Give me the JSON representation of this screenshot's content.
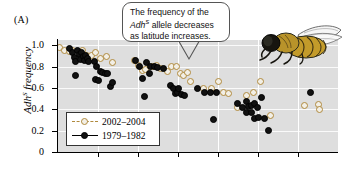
{
  "figure": {
    "panel_label": "(A)",
    "background_color": "#ffffff",
    "plot_background_color": "#dedede",
    "gridline_color": "#ffffff"
  },
  "callout": {
    "line1": "The frequency of the",
    "allele_italic": "Adh",
    "allele_sup": "S",
    "line2_rest": " allele decreases",
    "line3": "as latitude increases.",
    "full_text": "The frequency of the AdhS allele decreases as latitude increases."
  },
  "legend": {
    "items": [
      {
        "label": "2002–2004",
        "marker": "open-circle",
        "color": "#b08a3e",
        "line": "dashed"
      },
      {
        "label": "1979–1982",
        "marker": "filled-circle",
        "color": "#111111",
        "line": "solid"
      }
    ]
  },
  "axes": {
    "y_title_italic": "Adh",
    "y_title_sup": "S",
    "y_title_rest": " frequency",
    "y_ticks": [
      "1.0",
      "0.8",
      "0.6",
      "0.4",
      "0.2",
      "0"
    ],
    "y_tick_values": [
      1.0,
      0.8,
      0.6,
      0.4,
      0.2,
      0
    ],
    "x_ticks_labels": [],
    "x_tick_count": 6
  },
  "fly_illustration": {
    "name": "drosophila-fly",
    "body_color": "#c39b2a",
    "head_color": "#111111",
    "wing_color": "#f4f4f4"
  },
  "chart_data": {
    "type": "scatter",
    "title": "",
    "xlabel": "",
    "ylabel": "AdhS frequency",
    "ylim": [
      0,
      1.05
    ],
    "xlim": [
      0,
      1
    ],
    "grid": true,
    "legend_position": "bottom-left",
    "series": [
      {
        "name": "2002–2004",
        "marker": "open-circle",
        "color": "#b08a3e",
        "points": [
          [
            0.005,
            0.98
          ],
          [
            0.022,
            0.955
          ],
          [
            0.04,
            0.945
          ],
          [
            0.052,
            0.955
          ],
          [
            0.088,
            0.955
          ],
          [
            0.1,
            0.905
          ],
          [
            0.118,
            0.905
          ],
          [
            0.133,
            0.93
          ],
          [
            0.15,
            0.88
          ],
          [
            0.172,
            0.9
          ],
          [
            0.196,
            0.84
          ],
          [
            0.272,
            0.855
          ],
          [
            0.288,
            0.815
          ],
          [
            0.3,
            0.76
          ],
          [
            0.312,
            0.77
          ],
          [
            0.336,
            0.805
          ],
          [
            0.352,
            0.81
          ],
          [
            0.366,
            0.785
          ],
          [
            0.392,
            0.755
          ],
          [
            0.404,
            0.8
          ],
          [
            0.422,
            0.8
          ],
          [
            0.436,
            0.74
          ],
          [
            0.448,
            0.72
          ],
          [
            0.462,
            0.745
          ],
          [
            0.472,
            0.66
          ],
          [
            0.52,
            0.595
          ],
          [
            0.548,
            0.595
          ],
          [
            0.572,
            0.66
          ],
          [
            0.592,
            0.56
          ],
          [
            0.61,
            0.55
          ],
          [
            0.64,
            0.42
          ],
          [
            0.672,
            0.53
          ],
          [
            0.698,
            0.56
          ],
          [
            0.724,
            0.66
          ],
          [
            0.76,
            0.34
          ],
          [
            0.88,
            0.435
          ],
          [
            0.93,
            0.45
          ],
          [
            0.934,
            0.4
          ]
        ]
      },
      {
        "name": "1979–1982",
        "marker": "filled-circle",
        "color": "#111111",
        "points": [
          [
            0.04,
            0.975
          ],
          [
            0.052,
            0.93
          ],
          [
            0.058,
            0.885
          ],
          [
            0.062,
            0.845
          ],
          [
            0.07,
            0.955
          ],
          [
            0.076,
            0.91
          ],
          [
            0.08,
            0.87
          ],
          [
            0.084,
            0.935
          ],
          [
            0.09,
            0.9
          ],
          [
            0.094,
            0.86
          ],
          [
            0.098,
            0.905
          ],
          [
            0.104,
            0.875
          ],
          [
            0.108,
            0.845
          ],
          [
            0.062,
            0.72
          ],
          [
            0.13,
            0.85
          ],
          [
            0.136,
            0.8
          ],
          [
            0.15,
            0.755
          ],
          [
            0.16,
            0.745
          ],
          [
            0.17,
            0.74
          ],
          [
            0.176,
            0.735
          ],
          [
            0.134,
            0.68
          ],
          [
            0.146,
            0.67
          ],
          [
            0.186,
            0.61
          ],
          [
            0.196,
            0.655
          ],
          [
            0.278,
            0.86
          ],
          [
            0.29,
            0.8
          ],
          [
            0.3,
            0.69
          ],
          [
            0.316,
            0.84
          ],
          [
            0.33,
            0.805
          ],
          [
            0.344,
            0.805
          ],
          [
            0.356,
            0.79
          ],
          [
            0.326,
            0.735
          ],
          [
            0.31,
            0.52
          ],
          [
            0.376,
            0.78
          ],
          [
            0.4,
            0.62
          ],
          [
            0.412,
            0.6
          ],
          [
            0.42,
            0.545
          ],
          [
            0.428,
            0.56
          ],
          [
            0.432,
            0.6
          ],
          [
            0.44,
            0.54
          ],
          [
            0.45,
            0.53
          ],
          [
            0.498,
            0.6
          ],
          [
            0.522,
            0.56
          ],
          [
            0.545,
            0.555
          ],
          [
            0.566,
            0.555
          ],
          [
            0.556,
            0.305
          ],
          [
            0.64,
            0.455
          ],
          [
            0.658,
            0.42
          ],
          [
            0.672,
            0.47
          ],
          [
            0.68,
            0.43
          ],
          [
            0.69,
            0.44
          ],
          [
            0.7,
            0.455
          ],
          [
            0.712,
            0.42
          ],
          [
            0.726,
            0.51
          ],
          [
            0.672,
            0.375
          ],
          [
            0.69,
            0.37
          ],
          [
            0.7,
            0.31
          ],
          [
            0.716,
            0.325
          ],
          [
            0.736,
            0.31
          ],
          [
            0.752,
            0.205
          ],
          [
            0.9,
            0.555
          ]
        ]
      }
    ]
  }
}
